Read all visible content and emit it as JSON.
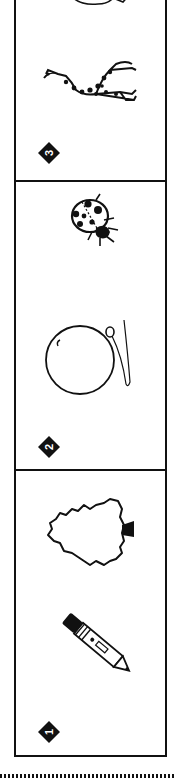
{
  "page": {
    "orientation": "rotated-90",
    "colors": {
      "ink": "#111111",
      "paper": "#ffffff"
    }
  },
  "cards": [
    {
      "number": "3",
      "items": [
        "giraffe",
        "partial-item-top"
      ]
    },
    {
      "number": "2",
      "items": [
        "ladybug",
        "balloon"
      ]
    },
    {
      "number": "1",
      "items": [
        "tree",
        "pencil"
      ]
    }
  ]
}
